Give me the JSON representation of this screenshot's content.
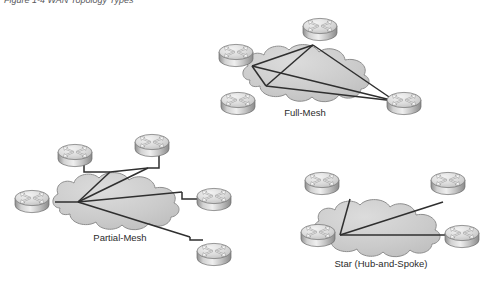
{
  "figure": {
    "caption": "Figure 1-4  WAN Topology Types"
  },
  "colors": {
    "cloud_fill": "#c9c9c9",
    "cloud_fill_light": "#d6d6d6",
    "cloud_stroke": "#8e8e8e",
    "link_stroke": "#2f2f2f",
    "router_top": "#e3e3e3",
    "router_body": "#b4b4b4",
    "router_stroke": "#6e6e6e",
    "label_color": "#2b2b2b",
    "page_background": "#ffffff"
  },
  "diagrams": [
    {
      "id": "full-mesh",
      "label": "Full-Mesh",
      "label_pos": {
        "x": 305,
        "y": 116
      },
      "cloud": {
        "cx": 310,
        "cy": 74,
        "rx": 62,
        "ry": 28
      },
      "routers": [
        {
          "name": "router-full-mesh-top",
          "x": 320,
          "y": 26
        },
        {
          "name": "router-full-mesh-left",
          "x": 236,
          "y": 52
        },
        {
          "name": "router-full-mesh-bottom-left",
          "x": 238,
          "y": 100
        },
        {
          "name": "router-full-mesh-bottom-right",
          "x": 404,
          "y": 100
        }
      ],
      "links": [
        {
          "from": [
            313,
            45
          ],
          "to": [
            266,
            86
          ]
        },
        {
          "from": [
            252,
            66
          ],
          "to": [
            395,
            101
          ]
        },
        {
          "from": [
            252,
            66
          ],
          "to": [
            266,
            86
          ]
        },
        {
          "from": [
            252,
            66
          ],
          "to": [
            313,
            45
          ]
        },
        {
          "from": [
            266,
            86
          ],
          "to": [
            395,
            101
          ]
        },
        {
          "from": [
            313,
            45
          ],
          "to": [
            395,
            101
          ]
        }
      ]
    },
    {
      "id": "partial-mesh",
      "label": "Partial-Mesh",
      "label_pos": {
        "x": 120,
        "y": 241
      },
      "cloud": {
        "cx": 120,
        "cy": 202,
        "rx": 62,
        "ry": 28
      },
      "routers": [
        {
          "name": "router-partial-mesh-top-left",
          "x": 75,
          "y": 152
        },
        {
          "name": "router-partial-mesh-top-right",
          "x": 152,
          "y": 142
        },
        {
          "name": "router-partial-mesh-left",
          "x": 32,
          "y": 198
        },
        {
          "name": "router-partial-mesh-right",
          "x": 208,
          "y": 196
        },
        {
          "name": "router-partial-mesh-bottom-right",
          "x": 205,
          "y": 250
        }
      ],
      "links": [
        {
          "from": [
            78,
            202
          ],
          "to": [
            110,
            172
          ]
        },
        {
          "from": [
            78,
            202
          ],
          "to": [
            148,
            168
          ]
        },
        {
          "from": [
            78,
            202
          ],
          "to": [
            182,
            192
          ]
        },
        {
          "from": [
            78,
            202
          ],
          "to": [
            190,
            237
          ]
        },
        {
          "from": [
            110,
            172
          ],
          "to": [
            148,
            168
          ]
        },
        {
          "from": [
            60,
            202
          ],
          "to": [
            78,
            202
          ]
        }
      ],
      "elbows": [
        {
          "points": "85,160 85,172 110,172"
        },
        {
          "points": "160,153 160,168 148,168"
        },
        {
          "points": "200,200 182,200 182,192"
        },
        {
          "points": "205,238 190,238 190,237"
        }
      ]
    },
    {
      "id": "star",
      "label": "Star (Hub-and-Spoke)",
      "label_pos": {
        "x": 381,
        "y": 267
      },
      "cloud": {
        "cx": 381,
        "cy": 229
      },
      "routers": [
        {
          "name": "router-star-top-left",
          "x": 322,
          "y": 180
        },
        {
          "name": "router-star-top-right",
          "x": 440,
          "y": 180
        },
        {
          "name": "router-star-hub",
          "x": 298,
          "y": 228
        },
        {
          "name": "router-star-right",
          "x": 458,
          "y": 230
        }
      ],
      "links": [
        {
          "from": [
            340,
            235
          ],
          "to": [
            350,
            199
          ]
        },
        {
          "from": [
            340,
            235
          ],
          "to": [
            443,
            202
          ]
        },
        {
          "from": [
            340,
            235
          ],
          "to": [
            470,
            235
          ]
        }
      ]
    }
  ],
  "router_icon": {
    "name": "cisco-router-icon",
    "description": "gray cylinder with four directional arrows on top"
  }
}
